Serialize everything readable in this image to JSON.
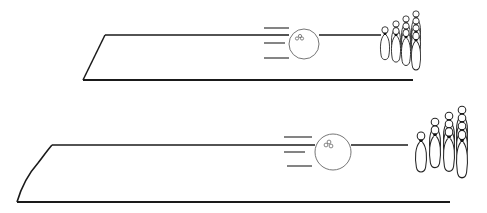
{
  "scene": {
    "description": "Line drawing of two bowling lanes, each with a rolling ball (speed lines) heading toward a rack of pins",
    "stroke_color": "#1a1a1a",
    "ball_stroke_color": "#555555",
    "background": "#ffffff"
  },
  "lanes": [
    {
      "name": "top-lane",
      "ball": {
        "cx": 304,
        "cy": 44,
        "r": 15
      },
      "speed_lines_count": 3,
      "pin_count": 10
    },
    {
      "name": "bottom-lane",
      "ball": {
        "cx": 333,
        "cy": 152,
        "r": 18
      },
      "speed_lines_count": 3,
      "pin_count": 10
    }
  ]
}
